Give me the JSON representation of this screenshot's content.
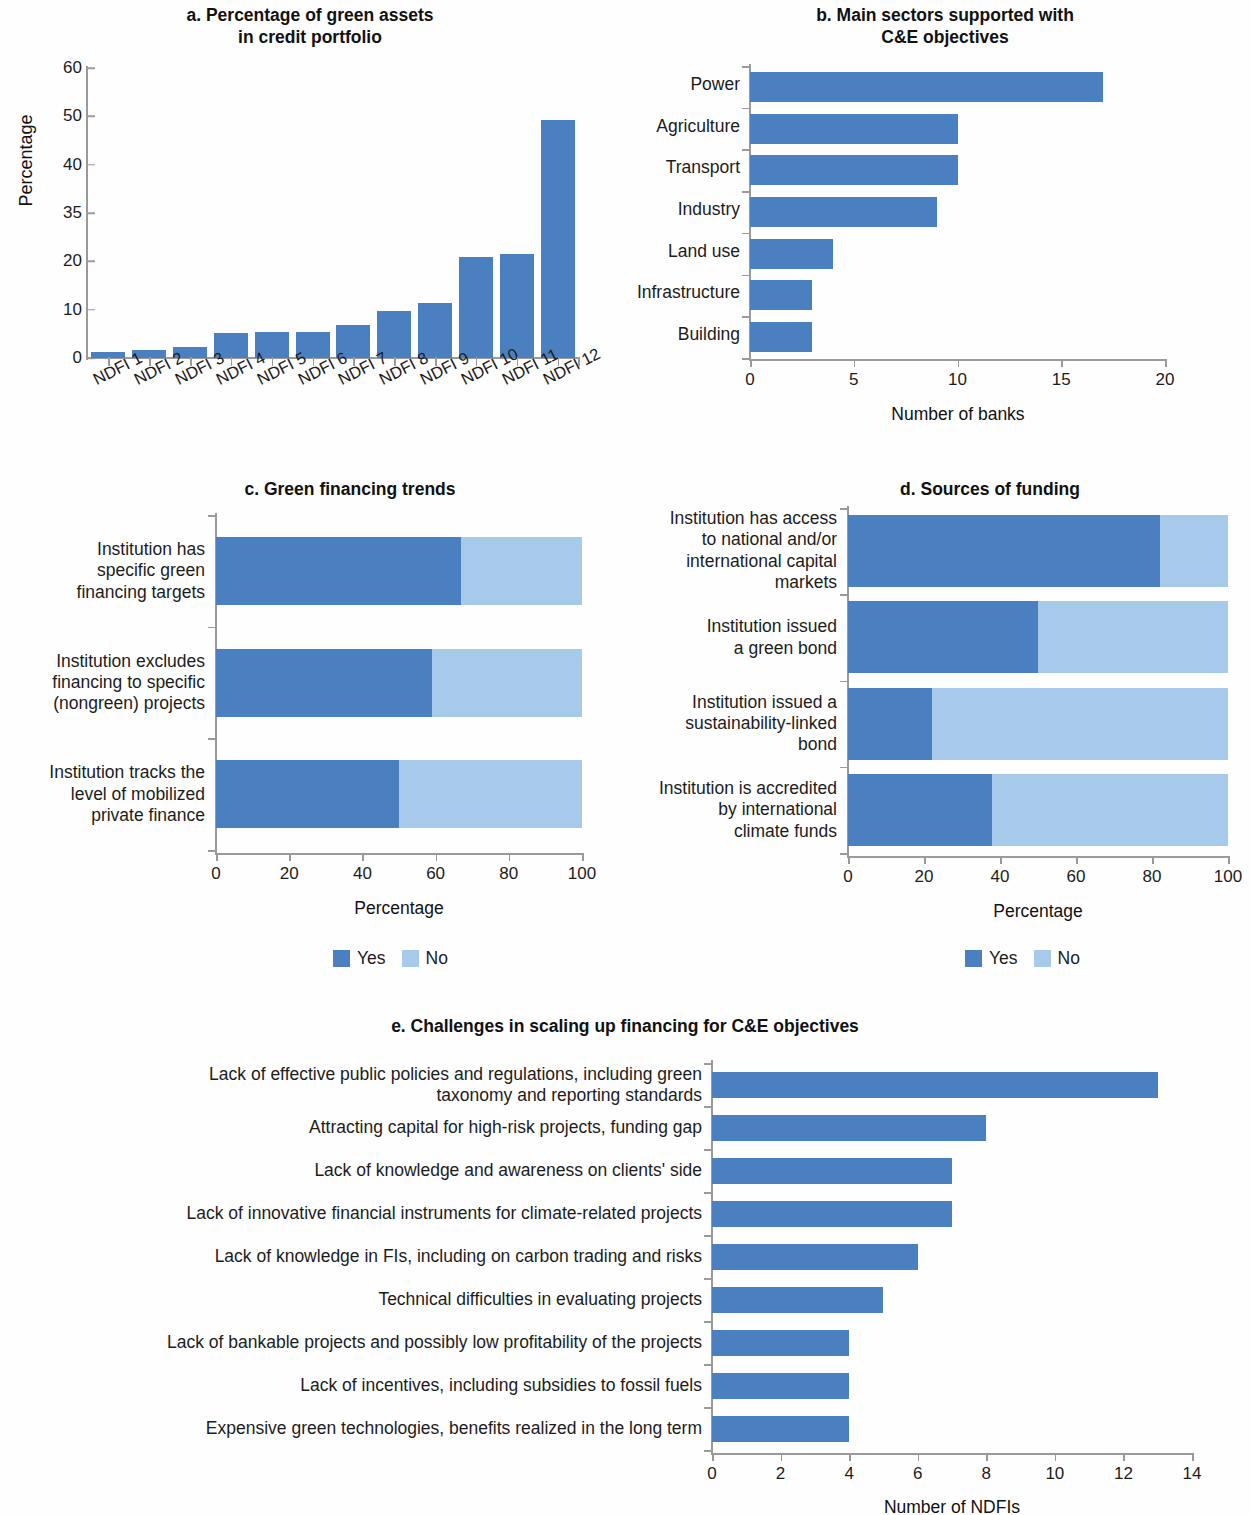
{
  "colors": {
    "yes": "#4a7fc0",
    "no": "#a7c9ea",
    "axis": "#9a9a9a",
    "text": "#1c1c1c"
  },
  "legend": {
    "yes": "Yes",
    "no": "No"
  },
  "chart_data": [
    {
      "id": "a",
      "type": "bar",
      "title": "a. Percentage of green assets\nin credit portfolio",
      "title_line1": "a. Percentage of green assets",
      "title_line2": "in credit portfolio",
      "xlabel": "",
      "ylabel": "Percentage",
      "categories": [
        "NDFI 1",
        "NDFI 2",
        "NDFI 3",
        "NDFI 4",
        "NDFI 5",
        "NDFI 6",
        "NDFI 7",
        "NDFI 8",
        "NDFI 9",
        "NDFI 10",
        "NDFI 11",
        "NDFI 12"
      ],
      "values": [
        1.3,
        1.6,
        2.3,
        5.1,
        5.3,
        5.4,
        6.9,
        9.7,
        11.3,
        21.5,
        22.4,
        49.2
      ],
      "ytick_labels": [
        "0",
        "10",
        "20",
        "35",
        "40",
        "50",
        "60"
      ],
      "ylim": [
        0,
        60
      ],
      "grid": false
    },
    {
      "id": "b",
      "type": "bar",
      "orientation": "horizontal",
      "title_line1": "b. Main sectors supported with",
      "title_line2": "C&E objectives",
      "xlabel": "Number of banks",
      "ylabel": "",
      "categories": [
        "Power",
        "Agriculture",
        "Transport",
        "Industry",
        "Land use",
        "Infrastructure",
        "Building"
      ],
      "values": [
        17,
        10,
        10,
        9,
        4,
        3,
        3
      ],
      "xtick_labels": [
        "0",
        "5",
        "10",
        "15",
        "20"
      ],
      "xlim": [
        0,
        20
      ],
      "grid": false
    },
    {
      "id": "c",
      "type": "bar",
      "orientation": "horizontal",
      "stacked": true,
      "title": "c. Green financing trends",
      "xlabel": "Percentage",
      "ylabel": "",
      "categories": [
        "Institution has specific green financing targets",
        "Institution excludes financing to specific (nongreen) projects",
        "Institution tracks the level of mobilized private finance"
      ],
      "category_lines": [
        [
          "Institution has",
          "specific green",
          "financing targets"
        ],
        [
          "Institution excludes",
          "financing to specific",
          "(nongreen) projects"
        ],
        [
          "Institution tracks the",
          "level of mobilized",
          "private finance"
        ]
      ],
      "series": [
        {
          "name": "Yes",
          "values": [
            67,
            59,
            50
          ]
        },
        {
          "name": "No",
          "values": [
            33,
            41,
            50
          ]
        }
      ],
      "xtick_labels": [
        "0",
        "20",
        "40",
        "60",
        "80",
        "100"
      ],
      "xlim": [
        0,
        100
      ],
      "legend_position": "bottom",
      "grid": false
    },
    {
      "id": "d",
      "type": "bar",
      "orientation": "horizontal",
      "stacked": true,
      "title": "d. Sources of funding",
      "xlabel": "Percentage",
      "ylabel": "",
      "categories": [
        "Institution has access to national and/or international capital markets",
        "Institution issued a green bond",
        "Institution issued a sustainability-linked bond",
        "Institution is accredited by international climate funds"
      ],
      "category_lines": [
        [
          "Institution has access",
          "to national and/or",
          "international capital",
          "markets"
        ],
        [
          "Institution issued",
          "a green bond"
        ],
        [
          "Institution issued a",
          "sustainability-linked",
          "bond"
        ],
        [
          "Institution is accredited",
          "by international",
          "climate funds"
        ]
      ],
      "series": [
        {
          "name": "Yes",
          "values": [
            82,
            50,
            22,
            38
          ]
        },
        {
          "name": "No",
          "values": [
            18,
            50,
            78,
            62
          ]
        }
      ],
      "xtick_labels": [
        "0",
        "20",
        "40",
        "60",
        "80",
        "100"
      ],
      "xlim": [
        0,
        100
      ],
      "legend_position": "bottom",
      "grid": false
    },
    {
      "id": "e",
      "type": "bar",
      "orientation": "horizontal",
      "title": "e. Challenges in scaling up financing for C&E objectives",
      "xlabel": "Number of NDFIs",
      "ylabel": "",
      "categories": [
        "Lack of effective public policies and regulations, including green taxonomy and reporting standards",
        "Attracting capital for high-risk projects, funding gap",
        "Lack of knowledge and awareness on clients' side",
        "Lack of innovative financial instruments for climate-related projects",
        "Lack of knowledge in FIs, including on carbon trading and risks",
        "Technical difficulties in evaluating projects",
        "Lack of bankable projects and possibly low profitability of the projects",
        "Lack of incentives, including subsidies to fossil fuels",
        "Expensive green technologies, benefits realized in the long term"
      ],
      "category_lines": [
        [
          "Lack of effective public policies and regulations, including green",
          "taxonomy and reporting standards"
        ],
        [
          "Attracting capital for high-risk projects, funding gap"
        ],
        [
          "Lack of knowledge and awareness on clients' side"
        ],
        [
          "Lack of innovative financial instruments for climate-related projects"
        ],
        [
          "Lack of knowledge in FIs, including on carbon trading and risks"
        ],
        [
          "Technical difficulties in evaluating projects"
        ],
        [
          "Lack of bankable projects and possibly low profitability of the projects"
        ],
        [
          "Lack of incentives, including subsidies to fossil fuels"
        ],
        [
          "Expensive green technologies, benefits realized in the long term"
        ]
      ],
      "values": [
        13,
        8,
        7,
        7,
        6,
        5,
        4,
        4,
        4
      ],
      "xtick_labels": [
        "0",
        "2",
        "4",
        "6",
        "8",
        "10",
        "12",
        "14"
      ],
      "xlim": [
        0,
        14
      ],
      "grid": false
    }
  ]
}
